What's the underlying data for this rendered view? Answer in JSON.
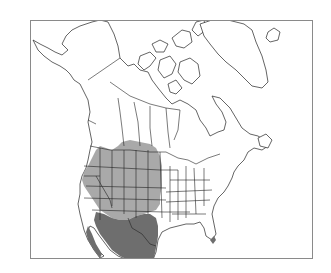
{
  "map": {
    "type": "species-range-map",
    "region": "North America",
    "frame": {
      "x": 30,
      "y": 20,
      "width": 283,
      "height": 239,
      "border_color": "#8a8a8a"
    },
    "legend": [],
    "colors": {
      "land": "#ffffff",
      "outline": "#222222",
      "range_light": "#a9a9a9",
      "range_dark": "#6e6e6e",
      "background": "#ffffff"
    },
    "ranges": [
      {
        "name": "light-range",
        "shade": "light",
        "area": "Western United States interior and Great Plains, southern Alberta/Saskatchewan"
      },
      {
        "name": "dark-range",
        "shade": "dark",
        "area": "Southwestern United States, Baja California, northern and central Mexico, southern Florida tip"
      }
    ]
  }
}
